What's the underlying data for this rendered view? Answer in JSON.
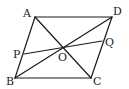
{
  "figure": {
    "type": "parallelogram",
    "points": {
      "A": {
        "label": "A",
        "x": 35,
        "y": 17,
        "lx": 23,
        "ly": 17
      },
      "B": {
        "label": "B",
        "x": 15,
        "y": 78,
        "lx": 6,
        "ly": 85
      },
      "C": {
        "label": "C",
        "x": 91,
        "y": 78,
        "lx": 93,
        "ly": 85
      },
      "D": {
        "label": "D",
        "x": 112,
        "y": 17,
        "lx": 113,
        "ly": 15
      },
      "O": {
        "label": "O",
        "x": 63,
        "y": 47.5,
        "lx": 58,
        "ly": 61
      },
      "P": {
        "label": "P",
        "x": 24,
        "y": 54,
        "lx": 13,
        "ly": 58
      },
      "Q": {
        "label": "Q",
        "x": 102,
        "y": 41,
        "lx": 105,
        "ly": 46
      }
    },
    "segments": [
      {
        "name": "side-AD",
        "from": "A",
        "to": "D"
      },
      {
        "name": "side-DC",
        "from": "D",
        "to": "C"
      },
      {
        "name": "side-CB",
        "from": "C",
        "to": "B"
      },
      {
        "name": "side-BA",
        "from": "B",
        "to": "A"
      },
      {
        "name": "diagonal-AC",
        "from": "A",
        "to": "C"
      },
      {
        "name": "diagonal-BD",
        "from": "B",
        "to": "D"
      },
      {
        "name": "segment-PQ",
        "from": "P",
        "to": "Q"
      }
    ],
    "stroke_color": "#1a1a1a",
    "background": "#ffffff"
  }
}
